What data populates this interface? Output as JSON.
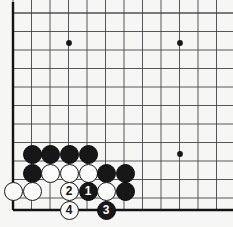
{
  "diagram": {
    "board": {
      "background_color": "#f6f6f4",
      "line_color": "#3a3a3c",
      "edge_line_color": "#1a1a1c",
      "origin_x": 13,
      "origin_y": 13,
      "spacing": 18.5,
      "cols_visible": 12,
      "rows_visible": 11,
      "bottom_edge_y": 210,
      "left_edge_x": 13
    },
    "star_points": [
      {
        "x": 69,
        "y": 43
      },
      {
        "x": 180,
        "y": 43
      },
      {
        "x": 180,
        "y": 154
      }
    ],
    "stones": [
      {
        "id": "b-c15-1",
        "color": "black",
        "x": 32,
        "y": 154,
        "label": ""
      },
      {
        "id": "b-c15-2",
        "color": "black",
        "x": 50,
        "y": 154,
        "label": ""
      },
      {
        "id": "b-c15-3",
        "color": "black",
        "x": 69,
        "y": 154,
        "label": ""
      },
      {
        "id": "b-c15-4",
        "color": "black",
        "x": 88,
        "y": 154,
        "label": ""
      },
      {
        "id": "b-c16-1",
        "color": "black",
        "x": 32,
        "y": 173,
        "label": ""
      },
      {
        "id": "w-c16-1",
        "color": "white",
        "x": 50,
        "y": 173,
        "label": ""
      },
      {
        "id": "w-c16-2",
        "color": "white",
        "x": 69,
        "y": 173,
        "label": ""
      },
      {
        "id": "w-c16-3",
        "color": "white",
        "x": 88,
        "y": 173,
        "label": ""
      },
      {
        "id": "b-c16-2",
        "color": "black",
        "x": 106,
        "y": 173,
        "label": ""
      },
      {
        "id": "b-c16-3",
        "color": "black",
        "x": 125,
        "y": 173,
        "label": ""
      },
      {
        "id": "w-c17-1",
        "color": "white",
        "x": 13,
        "y": 191,
        "label": ""
      },
      {
        "id": "w-c17-2",
        "color": "white",
        "x": 32,
        "y": 191,
        "label": ""
      },
      {
        "id": "move-2",
        "color": "white",
        "x": 69,
        "y": 191,
        "label": "2"
      },
      {
        "id": "move-1",
        "color": "black",
        "x": 88,
        "y": 191,
        "label": "1"
      },
      {
        "id": "w-c17-3",
        "color": "white",
        "x": 106,
        "y": 191,
        "label": ""
      },
      {
        "id": "b-c17-1",
        "color": "black",
        "x": 125,
        "y": 191,
        "label": ""
      },
      {
        "id": "move-4",
        "color": "white",
        "x": 69,
        "y": 210,
        "label": "4"
      },
      {
        "id": "move-3",
        "color": "black",
        "x": 106,
        "y": 210,
        "label": "3"
      }
    ],
    "move_numbers": [
      "1",
      "2",
      "3",
      "4"
    ],
    "stone_diameter": 19
  }
}
